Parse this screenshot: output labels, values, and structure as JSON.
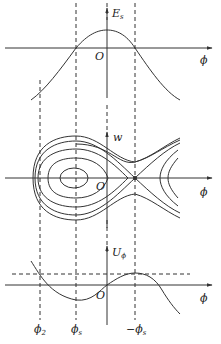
{
  "figure": {
    "panels": [
      {
        "id": "top",
        "y_label": "E",
        "y_label_sub": "s",
        "x_label": "ϕ",
        "origin_label": "O",
        "description": "E_s vs phi: bell-shaped curve peaking at phi = 0, crossing zero at phi_s and -phi_s"
      },
      {
        "id": "middle",
        "y_label": "w",
        "x_label": "ϕ",
        "origin_label": "O",
        "description": "Phase portrait (w vs phi): closed orbits around phi_s bounded by fish-shaped separatrix with saddle point at -phi_s"
      },
      {
        "id": "bottom",
        "y_label": "U",
        "y_label_sub": "ϕ",
        "x_label": "ϕ",
        "origin_label": "O",
        "description": "Potential U_phi: minimum at phi_s, maximum at -phi_s, dashed level line at maximum intersects curve at phi_2"
      }
    ],
    "markers": [
      {
        "label": "ϕ",
        "sub": "2",
        "prefix": ""
      },
      {
        "label": "ϕ",
        "sub": "s",
        "prefix": ""
      },
      {
        "label": "ϕ",
        "sub": "s",
        "prefix": "−"
      }
    ]
  }
}
